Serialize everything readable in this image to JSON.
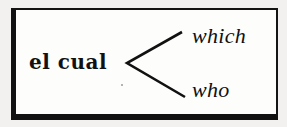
{
  "diagram": {
    "type": "branching-translation-diagram",
    "source_language": "Spanish",
    "target_language": "English",
    "source_term": "el cual",
    "branch_symbol": "<",
    "translations": [
      {
        "label": "which",
        "position": "top"
      },
      {
        "label": "who",
        "position": "bottom"
      }
    ],
    "colors": {
      "ink": "#111111",
      "paper": "#fdfdfc",
      "page_background": "#f2f1ef",
      "frame": "#141414"
    }
  }
}
